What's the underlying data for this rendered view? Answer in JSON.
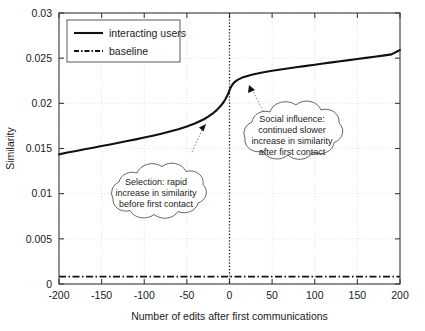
{
  "chart_data": {
    "type": "line",
    "title": "",
    "xlabel": "Number of edits after first communications",
    "ylabel": "Similarity",
    "xlim": [
      -200,
      200
    ],
    "ylim": [
      0,
      0.03
    ],
    "xticks": [
      -200,
      -150,
      -100,
      -50,
      0,
      50,
      100,
      150,
      200
    ],
    "xticklabels": [
      "-200",
      "-150",
      "-100",
      "-50",
      "0",
      "50",
      "100",
      "150",
      "200"
    ],
    "yticks": [
      0,
      0.005,
      0.01,
      0.015,
      0.02,
      0.025,
      0.03
    ],
    "yticklabels": [
      "0",
      "0.005",
      "0.01",
      "0.015",
      "0.02",
      "0.025",
      "0.03"
    ],
    "grid": true,
    "legend_position": "upper left",
    "series": [
      {
        "name": "interacting users",
        "style": "solid",
        "x": [
          -200,
          -190,
          -180,
          -170,
          -160,
          -150,
          -140,
          -130,
          -120,
          -110,
          -100,
          -90,
          -80,
          -70,
          -60,
          -50,
          -40,
          -30,
          -25,
          -20,
          -15,
          -10,
          -7,
          -5,
          -3,
          -2,
          -1,
          0,
          1,
          2,
          3,
          5,
          7,
          10,
          15,
          20,
          25,
          30,
          40,
          50,
          60,
          70,
          80,
          90,
          100,
          110,
          120,
          130,
          140,
          150,
          160,
          170,
          180,
          190,
          200
        ],
        "y": [
          0.01435,
          0.01455,
          0.01473,
          0.01491,
          0.01509,
          0.01527,
          0.01545,
          0.01563,
          0.01582,
          0.01601,
          0.01621,
          0.01642,
          0.01664,
          0.01688,
          0.01714,
          0.01743,
          0.01779,
          0.01824,
          0.01852,
          0.01885,
          0.01925,
          0.01975,
          0.02012,
          0.02042,
          0.02078,
          0.02098,
          0.0212,
          0.02143,
          0.02166,
          0.02185,
          0.02201,
          0.02225,
          0.02243,
          0.02262,
          0.02285,
          0.02301,
          0.02314,
          0.02325,
          0.02344,
          0.0236,
          0.02375,
          0.02389,
          0.02402,
          0.02415,
          0.02428,
          0.02441,
          0.02453,
          0.02466,
          0.02478,
          0.0249,
          0.02503,
          0.02515,
          0.02528,
          0.02542,
          0.0259
        ]
      },
      {
        "name": "baseline",
        "style": "dash-dot",
        "x": [
          -200,
          200
        ],
        "y": [
          0.00082,
          0.00082
        ]
      }
    ],
    "annotations": [
      {
        "id": "selection",
        "lines": [
          "Selection: rapid",
          "increase in similarity",
          "before first contact"
        ],
        "points_to_x": -30,
        "points_to_y": 0.0182
      },
      {
        "id": "social-influence",
        "lines": [
          "Social influence:",
          "continued slower",
          "increase in similarity",
          "after first contact"
        ],
        "points_to_x": 18,
        "points_to_y": 0.0229
      }
    ],
    "vertical_marker_x": 0
  },
  "colors": {
    "line": "#111111",
    "grid": "#d8d8d8",
    "frame": "#3a3a3a",
    "background": "#ffffff"
  }
}
